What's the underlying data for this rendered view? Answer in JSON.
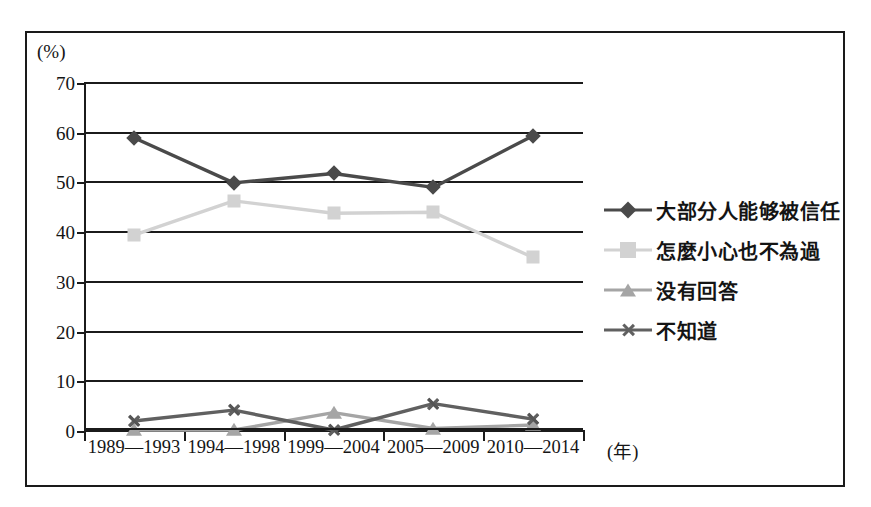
{
  "figure": {
    "unit_label": "(%)",
    "x_unit_label": "(年)"
  },
  "legend": {
    "position": "right",
    "items": [
      {
        "label": "大部分人能够被信任",
        "marker": "diamond-marker",
        "color": "#4a4a4a"
      },
      {
        "label": "怎麼小心也不為過",
        "marker": "square-marker",
        "color": "#d2d2d2"
      },
      {
        "label": "没有回答",
        "marker": "triangle-marker",
        "color": "#a5a5a5"
      },
      {
        "label": "不知道",
        "marker": "x-marker",
        "color": "#606060"
      }
    ]
  },
  "chart_data": {
    "type": "line",
    "title": "",
    "xlabel": "(年)",
    "ylabel": "(%)",
    "ylim": [
      0,
      70
    ],
    "yticks": [
      0,
      10,
      20,
      30,
      40,
      50,
      60,
      70
    ],
    "ytick_labels": [
      "0",
      "10",
      "20",
      "30",
      "40",
      "50",
      "60",
      "70"
    ],
    "grid": true,
    "categories": [
      "1989—1993",
      "1994—1998",
      "1999—2004",
      "2005—2009",
      "2010—2014"
    ],
    "series": [
      {
        "name": "大部分人能够被信任",
        "marker": "diamond",
        "color": "#4a4a4a",
        "values": [
          58.8,
          49.7,
          51.6,
          48.8,
          59.2
        ]
      },
      {
        "name": "怎麼小心也不為過",
        "marker": "square",
        "color": "#d2d2d2",
        "values": [
          39.2,
          46.1,
          43.6,
          43.8,
          34.7
        ]
      },
      {
        "name": "没有回答",
        "marker": "triangle",
        "color": "#a5a5a5",
        "values": [
          0.0,
          0.0,
          3.5,
          0.3,
          1.0
        ]
      },
      {
        "name": "不知道",
        "marker": "x",
        "color": "#606060",
        "values": [
          1.8,
          4.0,
          0.0,
          5.3,
          2.2
        ]
      }
    ]
  }
}
